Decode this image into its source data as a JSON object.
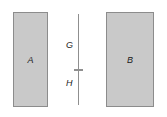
{
  "figure": {
    "blocks": [
      {
        "label": "A",
        "name": "block-a"
      },
      {
        "label": "B",
        "name": "block-b"
      }
    ],
    "dimensions": [
      {
        "label": "G",
        "name": "gap-upper"
      },
      {
        "label": "H",
        "name": "gap-lower"
      }
    ],
    "colors": {
      "block_fill": "#c9c9c9",
      "block_border": "#8c8c8c",
      "line": "#8f8f8f",
      "text": "#1a1a1a",
      "background": "#ffffff"
    }
  }
}
